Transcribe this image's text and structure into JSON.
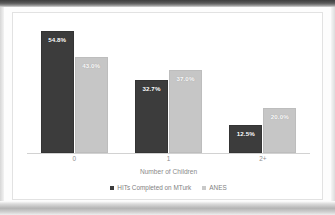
{
  "chart_data": {
    "type": "bar",
    "title": "",
    "xlabel": "Number of Children",
    "ylabel": "",
    "categories": [
      "0",
      "1",
      "2+"
    ],
    "grid": false,
    "legend_position": "bottom",
    "ylim": [
      0,
      60
    ],
    "series": [
      {
        "name": "HITs Completed on MTurk",
        "color": "#3c3c3c",
        "values": [
          54.8,
          32.7,
          12.5
        ],
        "labels": [
          "54.8%",
          "32.7%",
          "12.5%"
        ]
      },
      {
        "name": "ANES",
        "color": "#c6c6c6",
        "values": [
          43.0,
          37.0,
          20.0
        ],
        "labels": [
          "43.0%",
          "37.0%",
          "20.0%"
        ]
      }
    ]
  },
  "legend": {
    "items": [
      {
        "label": "HITs Completed on MTurk",
        "swatch": "legend-swatch-mturk"
      },
      {
        "label": "ANES",
        "swatch": "legend-swatch-anes"
      }
    ]
  },
  "axis": {
    "title": "Number of Children",
    "ticks": [
      "0",
      "1",
      "2+"
    ]
  }
}
